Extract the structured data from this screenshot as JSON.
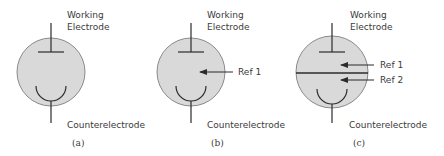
{
  "diagram": {
    "fill_color": "#d9d9d9",
    "stroke_color": "#2b2b2b",
    "panels": [
      {
        "id": "a",
        "caption": "(a)",
        "top_label_line1": "Working",
        "top_label_line2": "Electrode",
        "bottom_label": "Counterelectrode",
        "references": []
      },
      {
        "id": "b",
        "caption": "(b)",
        "top_label_line1": "Working",
        "top_label_line2": "Electrode",
        "bottom_label": "Counterelectrode",
        "references": [
          "Ref 1"
        ]
      },
      {
        "id": "c",
        "caption": "(c)",
        "top_label_line1": "Working",
        "top_label_line2": "Electrode",
        "bottom_label": "Counterelectrode",
        "references": [
          "Ref 1",
          "Ref 2"
        ],
        "has_divider": true
      }
    ]
  }
}
